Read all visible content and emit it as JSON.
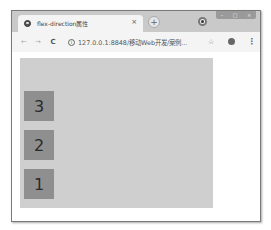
{
  "browser": {
    "tab": {
      "title": "flex-direction属性",
      "close": "×"
    },
    "new_tab": "+",
    "window_controls": {
      "minimize": "–",
      "maximize": "□",
      "close": "×"
    },
    "toolbar": {
      "back": "←",
      "forward": "→",
      "reload": "C",
      "info": "i",
      "url": "127.0.0.1:8848/移动Web开发/案例...",
      "star": "☆",
      "menu": "⋮"
    }
  },
  "page": {
    "container": {
      "flex_direction": "column-reverse",
      "background": "#cfcfcf"
    },
    "items": [
      {
        "label": "1"
      },
      {
        "label": "2"
      },
      {
        "label": "3"
      }
    ],
    "item_color": "#8f8f8f"
  }
}
